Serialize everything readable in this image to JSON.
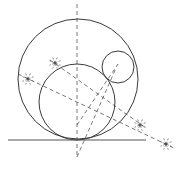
{
  "diagram": {
    "title": "",
    "colors": {
      "stroke": "#3a3a3a",
      "construction": "#555555",
      "background": "#ffffff"
    },
    "ground_line": {
      "x1": 8,
      "y1": 140,
      "x2": 146,
      "y2": 140
    },
    "axis_line": {
      "x1": 77,
      "y1": 4,
      "x2": 77,
      "y2": 158
    },
    "circles": [
      {
        "name": "large-circle",
        "cx": 78,
        "cy": 79,
        "r": 60
      },
      {
        "name": "medium-circle",
        "cx": 77,
        "cy": 102,
        "r": 38
      },
      {
        "name": "small-circle",
        "cx": 118,
        "cy": 67,
        "r": 16
      }
    ],
    "construction_lines": [
      {
        "name": "bisector-outer",
        "x1": 18,
        "y1": 74,
        "x2": 176,
        "y2": 149
      },
      {
        "name": "bisector-inner",
        "x1": 50,
        "y1": 60,
        "x2": 146,
        "y2": 128
      },
      {
        "name": "ray-to-small-center-1",
        "x1": 77,
        "y1": 125,
        "x2": 118,
        "y2": 64
      },
      {
        "name": "ray-to-small-center-2",
        "x1": 77,
        "y1": 157,
        "x2": 116,
        "y2": 68
      }
    ],
    "markers": [
      {
        "name": "marker-1",
        "x": 28,
        "y": 79
      },
      {
        "name": "marker-2",
        "x": 55,
        "y": 63
      },
      {
        "name": "marker-3",
        "x": 140,
        "y": 125
      },
      {
        "name": "marker-4",
        "x": 166,
        "y": 144
      }
    ]
  }
}
